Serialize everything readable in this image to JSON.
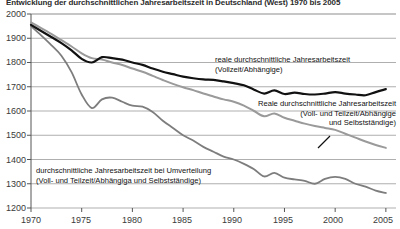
{
  "chart_data": {
    "type": "line",
    "title": "Entwicklung der durchschnittlichen Jahresarbeitszeit in Deutschland (West) 1970 bis 2005",
    "xlabel": "",
    "ylabel": "",
    "xlim": [
      1970,
      2006
    ],
    "ylim": [
      1200,
      2000
    ],
    "y_ticks": [
      1200,
      1300,
      1400,
      1500,
      1600,
      1700,
      1800,
      1900,
      2000
    ],
    "x_ticks": [
      1970,
      1975,
      1980,
      1985,
      1990,
      1995,
      2000,
      2005
    ],
    "grid": "horizontal",
    "legend": "annotations-inline",
    "x": [
      1970,
      1971,
      1972,
      1973,
      1974,
      1975,
      1976,
      1977,
      1978,
      1979,
      1980,
      1981,
      1982,
      1983,
      1984,
      1985,
      1986,
      1987,
      1988,
      1989,
      1990,
      1991,
      1992,
      1993,
      1994,
      1995,
      1996,
      1997,
      1998,
      1999,
      2000,
      2001,
      2002,
      2003,
      2004,
      2005
    ],
    "series": [
      {
        "name": "reale durchschnittliche Jahresarbeitszeit (Vollzeit/Abhängige)",
        "color": "#111111",
        "width": 2.2,
        "values": [
          1955,
          1930,
          1905,
          1880,
          1850,
          1815,
          1800,
          1822,
          1818,
          1812,
          1800,
          1790,
          1775,
          1762,
          1752,
          1742,
          1735,
          1730,
          1728,
          1722,
          1715,
          1706,
          1688,
          1672,
          1685,
          1670,
          1676,
          1670,
          1668,
          1672,
          1678,
          1672,
          1668,
          1665,
          1678,
          1690
        ]
      },
      {
        "name": "Reale durchschnittliche Jahresarbeitszeit (Voll- und Teilzeit/Abhängige und Selbstständige)",
        "color": "#9a9a9a",
        "width": 2.0,
        "values": [
          1965,
          1942,
          1918,
          1892,
          1866,
          1838,
          1818,
          1812,
          1800,
          1790,
          1775,
          1762,
          1745,
          1728,
          1712,
          1698,
          1686,
          1672,
          1660,
          1648,
          1638,
          1622,
          1600,
          1578,
          1590,
          1572,
          1560,
          1548,
          1538,
          1530,
          1522,
          1506,
          1490,
          1474,
          1460,
          1448
        ]
      },
      {
        "name": "durchschnittliche Jahresarbeitszeit bei Umverteilung (Voll- und Teilzeit/Abhängige und Selbstständige)",
        "color": "#7d7d7d",
        "width": 1.8,
        "values": [
          1950,
          1912,
          1872,
          1828,
          1760,
          1668,
          1612,
          1648,
          1655,
          1638,
          1622,
          1618,
          1596,
          1560,
          1530,
          1500,
          1478,
          1452,
          1432,
          1412,
          1400,
          1382,
          1360,
          1330,
          1345,
          1325,
          1318,
          1312,
          1300,
          1320,
          1328,
          1320,
          1300,
          1288,
          1272,
          1262
        ]
      }
    ]
  },
  "annotations": [
    {
      "id": "annot-vollzeit",
      "lines": [
        "reale durchschnittliche Jahresarbeitszeit",
        "(Vollzeit/Abhängige)"
      ]
    },
    {
      "id": "annot-vollteilzeit",
      "lines": [
        "Reale durchschnittliche Jahresarbeitszeit",
        "(Voll- und Teilzeit/Abhängige",
        "und Selbstständige)"
      ]
    },
    {
      "id": "annot-umverteilung",
      "lines": [
        "durchschnittliche Jahresarbeitszeit bei Umverteilung",
        "(Voll- und Teilzeit/Abhängiga und Selbstständige)"
      ]
    }
  ],
  "axis": {
    "y_labels": [
      "2000",
      "1900",
      "1800",
      "1700",
      "1600",
      "1500",
      "1400",
      "1300",
      "1200"
    ],
    "x_labels": [
      "1970",
      "1975",
      "1980",
      "1985",
      "1990",
      "1995",
      "2000",
      "2005"
    ]
  }
}
